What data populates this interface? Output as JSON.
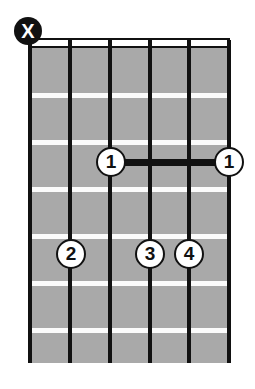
{
  "diagram": {
    "type": "guitar-chord-diagram",
    "instrument": "guitar",
    "string_count": 6,
    "fret_count": 6,
    "starting_fret": 1,
    "background_color": "#ffffff",
    "fretboard_color": "#a9a9a9",
    "fret_line_color": "#fbfbfb",
    "string_color": "#111111",
    "marker_fill_color": "#ffffff",
    "marker_text_color": "#111111",
    "muted_marker_fill_color": "#111111",
    "muted_marker_text_color": "#ffffff",
    "barre_color": "#111111"
  },
  "geometry": {
    "board_left": 28,
    "board_top": 48,
    "board_width": 202,
    "board_height": 315,
    "nut_top": 38,
    "nut_height": 10,
    "string_x": [
      30,
      70,
      110,
      150,
      189,
      229
    ],
    "fret_y": [
      93,
      140,
      187,
      234,
      281,
      328
    ],
    "dot_row_y": [
      162,
      254
    ]
  },
  "strings": [
    {
      "index": 1,
      "x": 30,
      "label": "string-1"
    },
    {
      "index": 2,
      "x": 70,
      "label": "string-2"
    },
    {
      "index": 3,
      "x": 110,
      "label": "string-3"
    },
    {
      "index": 4,
      "x": 150,
      "label": "string-4"
    },
    {
      "index": 5,
      "x": 189,
      "label": "string-5"
    },
    {
      "index": 6,
      "x": 229,
      "label": "string-6"
    }
  ],
  "frets": [
    {
      "index": 1,
      "y": 93
    },
    {
      "index": 2,
      "y": 140
    },
    {
      "index": 3,
      "y": 187
    },
    {
      "index": 4,
      "y": 234
    },
    {
      "index": 5,
      "y": 281
    },
    {
      "index": 6,
      "y": 328
    }
  ],
  "open_mute_markers": [
    {
      "symbol": "X",
      "string": 1,
      "x": 28,
      "y": 31,
      "state": "muted",
      "name": "mute-marker-string-1"
    }
  ],
  "finger_dots": [
    {
      "finger": "1",
      "string": 3,
      "fret": 3,
      "x": 111,
      "y": 162,
      "name": "finger-dot-1-string-3"
    },
    {
      "finger": "1",
      "string": 6,
      "fret": 3,
      "x": 229,
      "y": 162,
      "name": "finger-dot-1-string-6"
    },
    {
      "finger": "2",
      "string": 2,
      "fret": 5,
      "x": 71,
      "y": 254,
      "name": "finger-dot-2-string-2"
    },
    {
      "finger": "3",
      "string": 4,
      "fret": 5,
      "x": 150,
      "y": 254,
      "name": "finger-dot-3-string-4"
    },
    {
      "finger": "4",
      "string": 5,
      "fret": 5,
      "x": 189,
      "y": 254,
      "name": "finger-dot-4-string-5"
    }
  ],
  "barres": [
    {
      "finger": "1",
      "fret": 3,
      "from_string": 3,
      "to_string": 6,
      "x_start": 111,
      "x_end": 229,
      "y": 162,
      "name": "barre-fret-3"
    }
  ]
}
